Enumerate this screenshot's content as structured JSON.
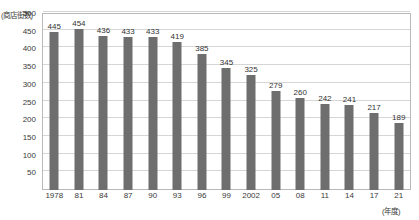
{
  "chart_data": {
    "type": "bar",
    "title": "",
    "ylabel": "(商店街数)",
    "xlabel": "(年度)",
    "ylim": [
      0,
      500
    ],
    "ytick_step": 50,
    "yticks": [
      500,
      450,
      400,
      350,
      300,
      250,
      200,
      150,
      100,
      50
    ],
    "grid": "horizontal",
    "legend": "none",
    "bar_color": "#6e6e6e",
    "categories": [
      "1978",
      "81",
      "84",
      "87",
      "90",
      "93",
      "96",
      "99",
      "2002",
      "05",
      "08",
      "11",
      "14",
      "17",
      "21"
    ],
    "values": [
      445,
      454,
      436,
      433,
      433,
      419,
      385,
      345,
      325,
      279,
      260,
      242,
      241,
      217,
      189
    ],
    "series": [
      {
        "name": "商店街数",
        "values": [
          445,
          454,
          436,
          433,
          433,
          419,
          385,
          345,
          325,
          279,
          260,
          242,
          241,
          217,
          189
        ]
      }
    ]
  }
}
